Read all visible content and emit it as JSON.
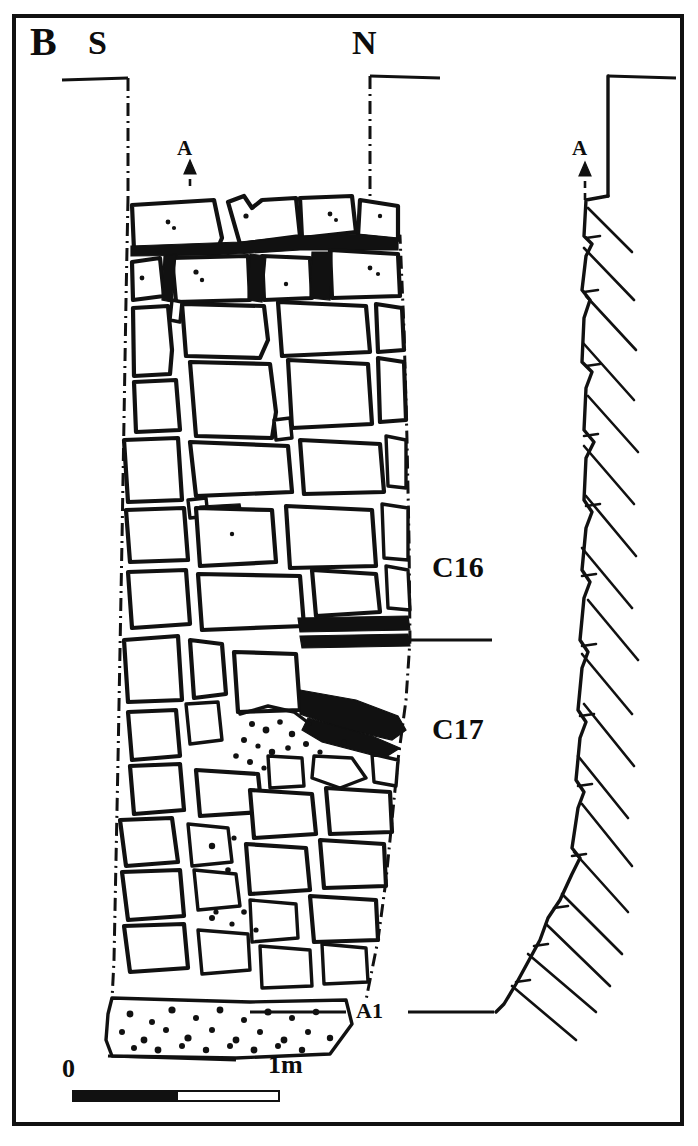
{
  "figure": {
    "panel_label": "B",
    "type": "archaeological-section-drawing"
  },
  "orientation": {
    "left_label": "S",
    "right_label": "N"
  },
  "markers": {
    "surface_left": "A",
    "surface_right": "A",
    "base": "A1"
  },
  "contexts": [
    {
      "id": "C16",
      "label": "C16"
    },
    {
      "id": "C17",
      "label": "C17"
    }
  ],
  "scale": {
    "start_label": "0",
    "end_label": "1m",
    "unit": "m",
    "length_value": 1,
    "segments": 2
  },
  "colors": {
    "ink": "#111111",
    "background": "#ffffff"
  }
}
